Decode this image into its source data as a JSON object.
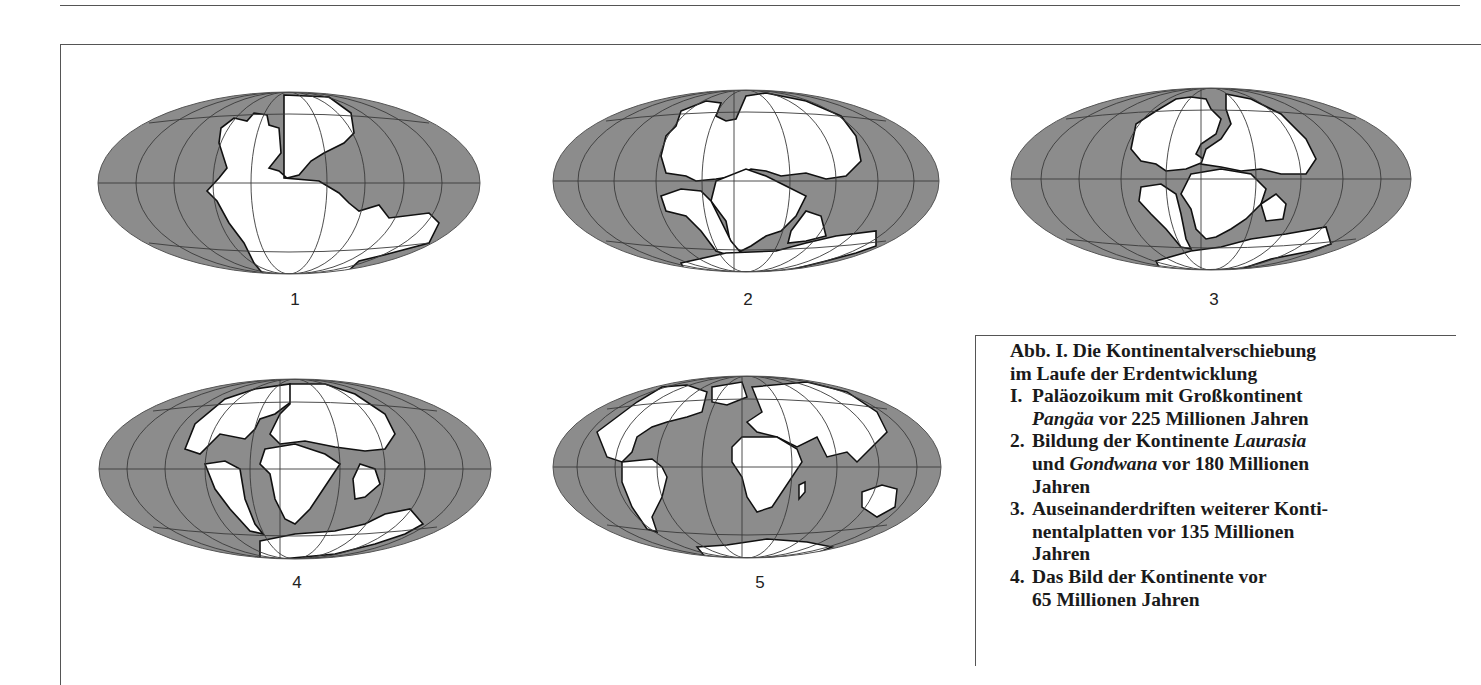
{
  "figure": {
    "colors": {
      "ocean": "#8c8c8c",
      "land": "#ffffff",
      "outline": "#111111",
      "grid": "#3a3a3a",
      "grid_on_land": "#9a9a9a"
    },
    "globes": [
      {
        "id": 1,
        "label": "1",
        "era": "Paläozoikum",
        "mya": 225
      },
      {
        "id": 2,
        "label": "2",
        "era": "Laurasia/Gondwana",
        "mya": 180
      },
      {
        "id": 3,
        "label": "3",
        "era": "Kontinentalplatten",
        "mya": 135
      },
      {
        "id": 4,
        "label": "4",
        "era": "Kontinente",
        "mya": 65
      },
      {
        "id": 5,
        "label": "5",
        "era": "Heute",
        "mya": 0
      }
    ]
  },
  "caption": {
    "title_line1": "Abb. I. Die Kontinentalverschiebung",
    "title_line2": "im Laufe der Erdentwicklung",
    "items": [
      {
        "num": "I.",
        "line1": "Paläozoikum mit Großkontinent",
        "line2_italic": "Pangäa",
        "line2_rest": " vor 225 Millionen Jahren"
      },
      {
        "num": "2.",
        "line1_pre": "Bildung der Kontinente ",
        "line1_italic": "Laurasia",
        "line2_pre": "und ",
        "line2_italic": "Gondwana",
        "line2_rest": " vor 180 Millionen",
        "line3": "Jahren"
      },
      {
        "num": "3.",
        "line1": "Auseinanderdriften weiterer Konti-",
        "line2": "nentalplatten vor 135 Millionen",
        "line3": "Jahren"
      },
      {
        "num": "4.",
        "line1": "Das Bild der Kontinente vor",
        "line2": "65 Millionen Jahren"
      }
    ]
  }
}
